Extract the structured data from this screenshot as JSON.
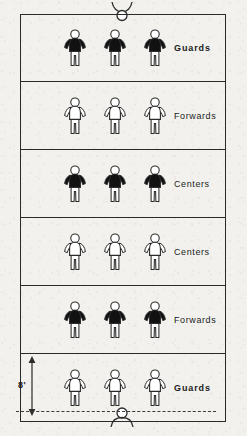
{
  "diagram": {
    "dimension": {
      "label": "8'",
      "name": "lane-depth-dimension"
    },
    "court": {
      "outline_color": "#2a2a2a",
      "background_color": "#f2f1ee"
    },
    "figure_colors": {
      "dark_team": "#111111",
      "light_team": "#ffffff",
      "outline": "#2b2b2b"
    },
    "shooters": [
      {
        "name": "shooter-top",
        "position": "top",
        "fill": "light"
      },
      {
        "name": "shooter-bottom",
        "position": "bottom",
        "fill": "light"
      }
    ],
    "rows": [
      {
        "index": 0,
        "label": "Guards",
        "emphasis": "bold",
        "fill": "dark",
        "players": 3
      },
      {
        "index": 1,
        "label": "Forwards",
        "emphasis": "regular",
        "fill": "light",
        "players": 3
      },
      {
        "index": 2,
        "label": "Centers",
        "emphasis": "regular",
        "fill": "dark",
        "players": 3
      },
      {
        "index": 3,
        "label": "Centers",
        "emphasis": "regular",
        "fill": "light",
        "players": 3
      },
      {
        "index": 4,
        "label": "Forwards",
        "emphasis": "regular",
        "fill": "dark",
        "players": 3
      },
      {
        "index": 5,
        "label": "Guards",
        "emphasis": "bold",
        "fill": "light",
        "players": 3
      }
    ]
  }
}
